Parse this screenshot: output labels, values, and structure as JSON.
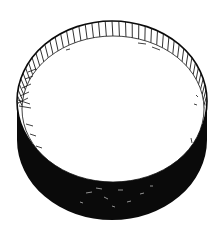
{
  "illustration": {
    "subject": "cylindrical lid drawing",
    "background_color": "#ffffff",
    "ink_color": "#0a0a0a",
    "face_color": "#ffffff",
    "rim_ribs": 44
  }
}
